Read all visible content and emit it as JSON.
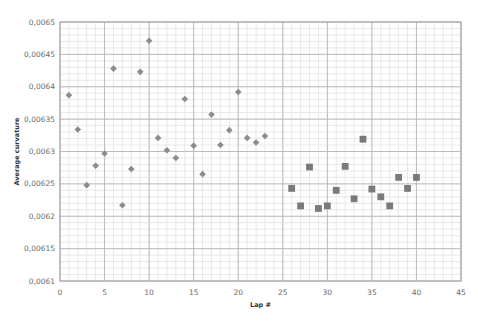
{
  "chart_data": {
    "type": "scatter",
    "title": "",
    "xlabel": "Lap #",
    "ylabel": "Average curvature",
    "xlim": [
      0,
      45
    ],
    "ylim": [
      0.0061,
      0.0065
    ],
    "x_ticks": [
      0,
      5,
      10,
      15,
      20,
      25,
      30,
      35,
      40,
      45
    ],
    "x_tick_labels": [
      "0",
      "5",
      "10",
      "15",
      "20",
      "25",
      "30",
      "35",
      "40",
      "45"
    ],
    "y_ticks": [
      0.0061,
      0.00615,
      0.0062,
      0.00625,
      0.0063,
      0.00635,
      0.0064,
      0.00645,
      0.0065
    ],
    "y_tick_labels": [
      "0,0061",
      "0,00615",
      "0,0062",
      "0,00625",
      "0,0063",
      "0,00635",
      "0,0064",
      "0,00645",
      "0,0065"
    ],
    "grid": true,
    "legend": null,
    "series": [
      {
        "name": "Series 1",
        "marker": "diamond",
        "color": "#8c8c8c",
        "x": [
          1,
          2,
          3,
          4,
          5,
          6,
          7,
          8,
          9,
          10,
          11,
          12,
          13,
          14,
          15,
          16,
          17,
          18,
          19,
          20,
          21,
          22,
          23
        ],
        "y": [
          0.006387,
          0.006334,
          0.006248,
          0.006278,
          0.006297,
          0.006428,
          0.006217,
          0.006273,
          0.006423,
          0.006471,
          0.006321,
          0.006302,
          0.00629,
          0.006381,
          0.006309,
          0.006265,
          0.006357,
          0.00631,
          0.006333,
          0.006392,
          0.006321,
          0.006314,
          0.006324
        ]
      },
      {
        "name": "Series 2",
        "marker": "square",
        "color": "#7a7a7a",
        "x": [
          26,
          27,
          28,
          29,
          30,
          31,
          32,
          33,
          34,
          35,
          36,
          37,
          38,
          39,
          40
        ],
        "y": [
          0.006243,
          0.006216,
          0.006276,
          0.006212,
          0.006216,
          0.00624,
          0.006277,
          0.006227,
          0.006319,
          0.006242,
          0.00623,
          0.006216,
          0.00626,
          0.006243,
          0.00626
        ]
      }
    ]
  },
  "colors": {
    "major_grid": "#b8b8b8",
    "minor_grid": "#e2e2e2",
    "axis": "#9a9a9a"
  }
}
